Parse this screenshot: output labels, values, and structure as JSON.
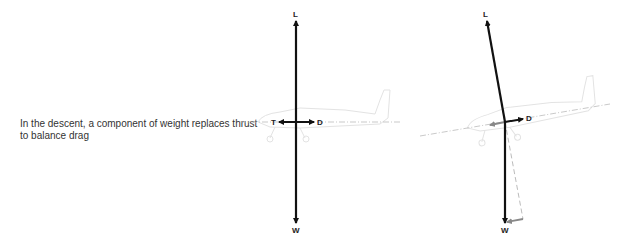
{
  "caption": "In the descent, a component of weight replaces thrust to balance drag",
  "colors": {
    "force_arrow": "#111111",
    "component_arrow": "#888888",
    "datum_line": "#bbbbbb",
    "aircraft_outline": "#e6e6e6",
    "caption_text": "#333333"
  },
  "level_flight": {
    "labels": {
      "lift": "L",
      "weight": "W",
      "thrust": "T",
      "drag": "D"
    }
  },
  "descent": {
    "labels": {
      "lift": "L",
      "weight": "W",
      "drag": "D"
    }
  }
}
